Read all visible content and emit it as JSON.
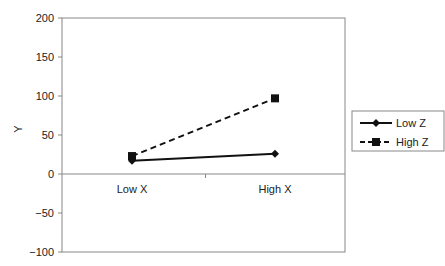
{
  "chart_data": {
    "type": "line",
    "title": "",
    "xlabel": "",
    "ylabel": "Y",
    "categories": [
      "Low X",
      "High X"
    ],
    "series": [
      {
        "name": "Low Z",
        "style": "solid",
        "marker": "diamond",
        "values": [
          17,
          26
        ]
      },
      {
        "name": "High Z",
        "style": "dashed",
        "marker": "square",
        "values": [
          23,
          97
        ]
      }
    ],
    "ylim": [
      -100,
      200
    ],
    "yticks": [
      200,
      150,
      100,
      50,
      0,
      -50,
      -100
    ],
    "grid": false,
    "legend_position": "right"
  },
  "colors": {
    "line": "#111111",
    "axis": "#888888"
  }
}
